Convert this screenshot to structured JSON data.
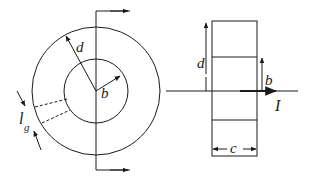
{
  "figure": {
    "front_view": {
      "labels": {
        "outer_radius": "d",
        "inner_radius": "b",
        "gap_length": "l",
        "gap_subscript": "g"
      }
    },
    "side_view": {
      "labels": {
        "height": "d",
        "inner": "b",
        "width": "c",
        "current": "I"
      }
    },
    "colors": {
      "stroke": "#1a1a1a",
      "background": "#ffffff"
    }
  }
}
